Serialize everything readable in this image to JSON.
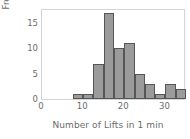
{
  "chart_data": {
    "type": "bar",
    "title": "",
    "subtitle": "",
    "xlabel": "Number of Lifts in 1 min",
    "ylabel": "Frequency",
    "grid": false,
    "legend": null,
    "xlim": [
      0,
      35
    ],
    "ylim": [
      0,
      18
    ],
    "x_ticks": [
      0,
      10,
      20,
      30
    ],
    "x_tick_labels": [
      "0",
      "10",
      "20",
      "30"
    ],
    "y_ticks": [
      0,
      5,
      10,
      15
    ],
    "y_tick_labels": [
      "0",
      "5",
      "10",
      "15"
    ],
    "bin_width": 2.5,
    "bin_edges": [
      7.5,
      10,
      12.5,
      15,
      17.5,
      20,
      22.5,
      25,
      27.5,
      30,
      32.5,
      35
    ],
    "categories": [
      "7.5-10",
      "10-12.5",
      "12.5-15",
      "15-17.5",
      "17.5-20",
      "20-22.5",
      "22.5-25",
      "25-27.5",
      "27.5-30",
      "30-32.5",
      "32.5-35"
    ],
    "values": [
      1,
      1,
      7,
      17,
      10,
      11,
      5,
      3,
      1,
      3,
      2
    ],
    "bar_fill_color": "#9b9b9b",
    "bar_edge_color": "#565656",
    "axis_color": "#d4d4d4",
    "text_color": "#6b6b6b"
  }
}
